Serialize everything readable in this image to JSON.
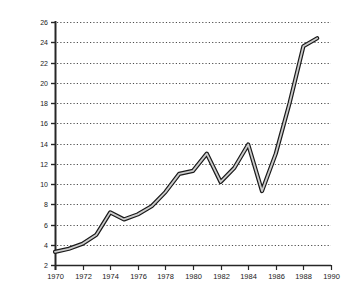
{
  "chart_data": {
    "type": "line",
    "title": "",
    "subtitle": "",
    "xlabel": "",
    "ylabel": "BILLIONS OF DOLLARS",
    "x": [
      1970,
      1971,
      1972,
      1973,
      1974,
      1975,
      1976,
      1977,
      1978,
      1979,
      1980,
      1981,
      1982,
      1983,
      1984,
      1985,
      1986,
      1987,
      1988,
      1989
    ],
    "values": [
      3.3,
      3.6,
      4.1,
      5.0,
      7.2,
      6.5,
      7.0,
      7.8,
      9.2,
      11.0,
      11.3,
      13.0,
      10.2,
      11.6,
      13.9,
      9.3,
      13.0,
      18.0,
      23.6,
      24.4
    ],
    "series": [
      {
        "name": "Billions of dollars",
        "values": [
          3.3,
          3.6,
          4.1,
          5.0,
          7.2,
          6.5,
          7.0,
          7.8,
          9.2,
          11.0,
          11.3,
          13.0,
          10.2,
          11.6,
          13.9,
          9.3,
          13.0,
          18.0,
          23.6,
          24.4
        ]
      }
    ],
    "xlim": [
      1970,
      1990
    ],
    "ylim": [
      2,
      26
    ],
    "ytick_step": 2,
    "xtick_step": 2,
    "xticks": [
      "1970",
      "1972",
      "1974",
      "1976",
      "1978",
      "1980",
      "1982",
      "1984",
      "1986",
      "1988",
      "1990"
    ],
    "yticks": [
      "2",
      "4",
      "6",
      "8",
      "10",
      "12",
      "14",
      "16",
      "18",
      "20",
      "22",
      "24",
      "26"
    ],
    "grid": "horizontal-dotted",
    "legend": "none",
    "legend_position": "",
    "annotations": [],
    "colors": {
      "background": "#ffffff",
      "axis": "#262626",
      "gridline": "#4d4d4d",
      "line_outline": "#1a1a1a",
      "line_fill": "#d0d0d0",
      "tick_label": "#1a1a1a"
    }
  },
  "axis_label_letters": [
    "B",
    "I",
    "L",
    "L",
    "I",
    "O",
    "N",
    "S",
    "",
    "O",
    "F",
    "",
    "D",
    "O",
    "L",
    "L",
    "A",
    "R",
    "S"
  ]
}
